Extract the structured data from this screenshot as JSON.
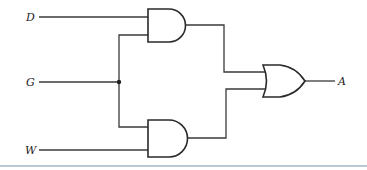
{
  "diagram": {
    "type": "logic-circuit",
    "inputs": [
      {
        "id": "D",
        "label": "D"
      },
      {
        "id": "G",
        "label": "G"
      },
      {
        "id": "W",
        "label": "W"
      }
    ],
    "output": {
      "id": "A",
      "label": "A"
    },
    "gates": [
      {
        "id": "and1",
        "type": "AND",
        "inputs": [
          "D",
          "G"
        ]
      },
      {
        "id": "and2",
        "type": "AND",
        "inputs": [
          "G",
          "W"
        ]
      },
      {
        "id": "or1",
        "type": "OR",
        "inputs": [
          "and1",
          "and2"
        ],
        "output": "A"
      }
    ],
    "junctions": [
      {
        "net": "G"
      }
    ],
    "colors": {
      "wire": "#3a3a3a",
      "gate_stroke": "#2a2a2a",
      "divider": "#b8c8d4"
    }
  }
}
